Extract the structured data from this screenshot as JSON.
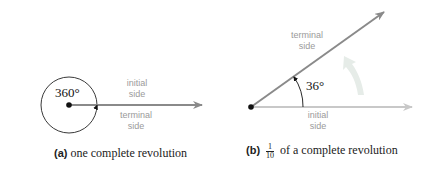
{
  "panel_a": {
    "angle_label": "360°",
    "initial_label_line1": "initial",
    "initial_label_line2": "side",
    "terminal_label_line1": "terminal",
    "terminal_label_line2": "side",
    "caption_tag": "(a)",
    "caption_text": "one complete revolution"
  },
  "panel_b": {
    "angle_label": "36°",
    "terminal_label_line1": "terminal",
    "terminal_label_line2": "side",
    "initial_label_line1": "initial",
    "initial_label_line2": "side",
    "caption_tag": "(b)",
    "fraction_numerator": "1",
    "fraction_denominator": "10",
    "caption_text": "of a complete revolution"
  },
  "colors": {
    "ray": "#8a8a8a",
    "ray_light": "#c8c8c8",
    "label_gray": "#9a9a9a",
    "arrow_fill": "#e6ece8",
    "ink": "#111111"
  }
}
